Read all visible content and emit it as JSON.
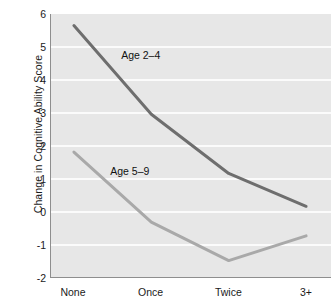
{
  "chart_data": {
    "type": "line",
    "title": "",
    "xlabel": "",
    "ylabel": "Change in Cognitive Ability Score",
    "categories": [
      "None",
      "Once",
      "Twice",
      "3+"
    ],
    "ylim": [
      -2,
      6
    ],
    "yticks": [
      6,
      5,
      4,
      3,
      2,
      1,
      0,
      -1,
      -2
    ],
    "ytick_labels": [
      "6",
      "5",
      "4",
      "3",
      "2",
      "1",
      "0",
      "-1",
      "-2"
    ],
    "grid": "horizontal",
    "legend_position": "inline-annotation",
    "series": [
      {
        "name": "Age 2–4",
        "values": [
          5.65,
          2.95,
          1.15,
          0.15
        ],
        "color": "#6e6e6e"
      },
      {
        "name": "Age 5–9",
        "values": [
          1.8,
          -0.33,
          -1.5,
          -0.75
        ],
        "color": "#a9a9a9"
      }
    ],
    "annotations": [
      {
        "text": "Age 2–4",
        "x": 0.62,
        "y": 4.72
      },
      {
        "text": "Age 5–9",
        "x": 0.48,
        "y": 1.22
      }
    ]
  },
  "colors": {
    "plot_background": "#e7e7e7",
    "gridline": "#fbfbfb",
    "axis": "#8e8e8e",
    "text": "#1a1a1a",
    "series_dark": "#6e6e6e",
    "series_light": "#a9a9a9"
  }
}
